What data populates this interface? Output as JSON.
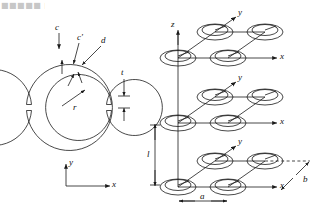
{
  "figure": {
    "corner_artifact_text": "■■■■■ ■■",
    "panels": [
      {
        "id": "srr-cross-section",
        "name": "split-ring-resonator-cross-section",
        "labels": {
          "c": "c",
          "c_prime": "c'",
          "d": "d",
          "t": "t",
          "r": "r",
          "axis_x": "x",
          "axis_y": "y"
        }
      },
      {
        "id": "srr-lattice-array",
        "name": "three-dimensional-srr-lattice",
        "labels": {
          "axis_x": "x",
          "axis_y": "y",
          "axis_z": "z",
          "lattice_l": "l",
          "lattice_a": "a",
          "lattice_b": "b"
        },
        "layers": 3,
        "rings_per_layer": 4
      }
    ]
  },
  "left_panel": {
    "label_c": "c",
    "label_c_prime": "c'",
    "label_d": "d",
    "label_t": "t",
    "label_r": "r",
    "label_x": "x",
    "label_y": "y"
  },
  "right_panel": {
    "label_z": "z",
    "label_y_top": "y",
    "label_y_mid": "y",
    "label_y_bottom": "y",
    "label_x_top": "x",
    "label_x_mid": "x",
    "label_x_bottom": "x",
    "label_l": "l",
    "label_a": "a",
    "label_b": "b"
  },
  "style": {
    "stroke": "#1a1a1a",
    "background": "#ffffff"
  }
}
